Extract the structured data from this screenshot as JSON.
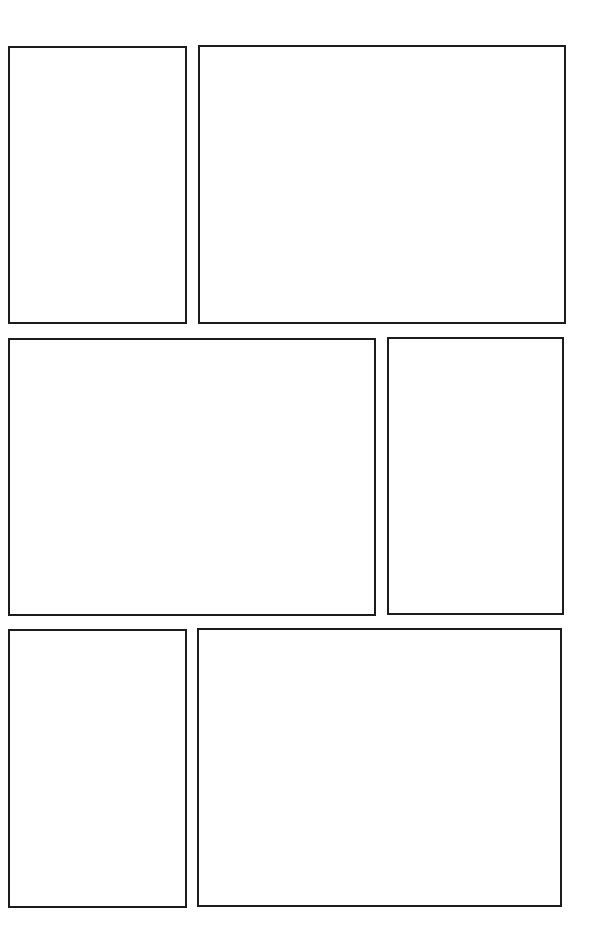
{
  "page": {
    "type": "comic-panel-template",
    "background_color": "#ffffff",
    "border_color": "#1c1c1c",
    "rows": 3,
    "panel_count": 6
  },
  "panels": [
    {
      "id": 1,
      "row": 1,
      "x": 8,
      "y": 46,
      "w": 179,
      "h": 278,
      "content": ""
    },
    {
      "id": 2,
      "row": 1,
      "x": 198,
      "y": 45,
      "w": 368,
      "h": 279,
      "content": ""
    },
    {
      "id": 3,
      "row": 2,
      "x": 8,
      "y": 338,
      "w": 368,
      "h": 278,
      "content": ""
    },
    {
      "id": 4,
      "row": 2,
      "x": 387,
      "y": 337,
      "w": 177,
      "h": 278,
      "content": ""
    },
    {
      "id": 5,
      "row": 3,
      "x": 8,
      "y": 629,
      "w": 179,
      "h": 279,
      "content": ""
    },
    {
      "id": 6,
      "row": 3,
      "x": 197,
      "y": 628,
      "w": 365,
      "h": 279,
      "content": ""
    }
  ]
}
